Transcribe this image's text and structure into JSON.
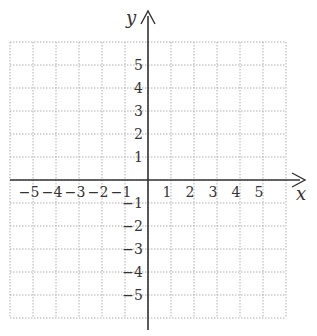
{
  "diagram": {
    "type": "coordinate-plane",
    "x_axis_label": "x",
    "y_axis_label": "y",
    "grid_range": {
      "min": -6,
      "max": 6
    },
    "x_tick_labels": [
      "-5",
      "-4",
      "-3",
      "-2",
      "-1",
      "1",
      "2",
      "3",
      "4",
      "5"
    ],
    "y_tick_labels": [
      "5",
      "4",
      "3",
      "2",
      "1",
      "-1",
      "-2",
      "-3",
      "-4",
      "-5"
    ],
    "colors": {
      "axis": "#333333",
      "grid": "#b0b0b0",
      "text": "#333333"
    }
  }
}
